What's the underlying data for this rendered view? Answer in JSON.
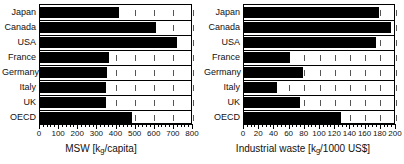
{
  "figure": {
    "background": "#ffffff",
    "bar_color": "#000000",
    "axis_color": "#000000"
  },
  "chart_data": [
    {
      "type": "bar",
      "orientation": "horizontal",
      "panel": "left",
      "title": "",
      "xlabel": "MSW [kg/capita]",
      "xlabel_main": "MSW [k",
      "xlabel_sub": "g",
      "xlabel_tail": "/capita]",
      "ylabel": "",
      "categories": [
        "Japan",
        "Canada",
        "USA",
        "France",
        "Germany",
        "Italy",
        "UK",
        "OECD"
      ],
      "values": [
        415,
        605,
        715,
        360,
        350,
        345,
        345,
        480
      ],
      "xlim": [
        0,
        800
      ],
      "xticks": [
        0,
        100,
        200,
        300,
        400,
        500,
        600,
        700,
        800
      ],
      "xticklabels": [
        "0",
        "100",
        "200",
        "300",
        "400",
        "500",
        "600",
        "700",
        "800"
      ],
      "minor_tick_step": 20,
      "grid": "vertical-dashed-inside",
      "legend": "none"
    },
    {
      "type": "bar",
      "orientation": "horizontal",
      "panel": "right",
      "title": "",
      "xlabel": "Industrial waste [kg/1000 US$]",
      "xlabel_main": "Industrial waste [k",
      "xlabel_sub": "g",
      "xlabel_tail": "/1000 US$]",
      "ylabel": "",
      "categories": [
        "Japan",
        "Canada",
        "USA",
        "France",
        "Germany",
        "Italy",
        "UK",
        "OECD"
      ],
      "values": [
        177,
        193,
        174,
        61,
        77,
        44,
        74,
        127
      ],
      "xlim": [
        0,
        200
      ],
      "xticks": [
        0,
        20,
        40,
        60,
        80,
        100,
        120,
        140,
        160,
        180,
        200
      ],
      "xticklabels": [
        "0",
        "20",
        "40",
        "60",
        "80",
        "100",
        "120",
        "140",
        "160",
        "180",
        "200"
      ],
      "minor_tick_step": 5,
      "grid": "vertical-dashed-inside",
      "legend": "none"
    }
  ]
}
